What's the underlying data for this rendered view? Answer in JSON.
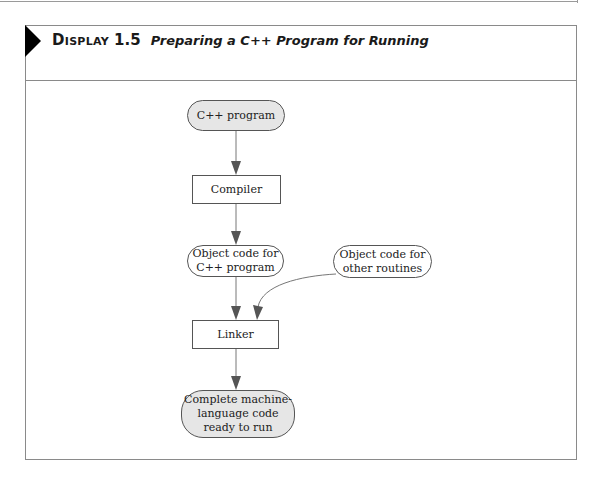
{
  "display": {
    "label": "Display",
    "number": "1.5",
    "title": "Preparing a C++ Program for Running"
  },
  "nodes": {
    "cpp_program": {
      "text": "C++ program",
      "shape": "rounded",
      "fill": "#e6e6e6"
    },
    "compiler": {
      "text": "Compiler",
      "shape": "rectangle",
      "fill": "#ffffff"
    },
    "object_code_cpp": {
      "line1": "Object code for",
      "line2": "C++ program",
      "shape": "rounded",
      "fill": "#ffffff"
    },
    "object_code_other": {
      "line1": "Object code for",
      "line2": "other routines",
      "shape": "rounded",
      "fill": "#ffffff"
    },
    "linker": {
      "text": "Linker",
      "shape": "rectangle",
      "fill": "#ffffff"
    },
    "machine_code": {
      "line1": "Complete machine-",
      "line2": "language code",
      "line3": "ready to run",
      "shape": "rounded",
      "fill": "#e6e6e6"
    }
  },
  "edges": [
    {
      "from": "cpp_program",
      "to": "compiler"
    },
    {
      "from": "compiler",
      "to": "object_code_cpp"
    },
    {
      "from": "object_code_cpp",
      "to": "linker"
    },
    {
      "from": "object_code_other",
      "to": "linker",
      "curved": true
    },
    {
      "from": "linker",
      "to": "machine_code"
    }
  ],
  "colors": {
    "border": "#555555",
    "gray_fill": "#e6e6e6",
    "arrow": "#555555"
  }
}
